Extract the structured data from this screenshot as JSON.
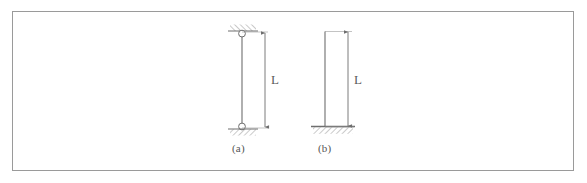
{
  "figure": {
    "caption_a": "(a)",
    "caption_b": "(b)",
    "dimension_label_a": "L",
    "dimension_label_b": "L",
    "border_color": "#9a9a9a",
    "line_color": "#6e6e6e",
    "hatch_color": "#8a8a8a",
    "text_color": "#555555",
    "background_color": "#ffffff"
  },
  "diagram_a": {
    "name": "pinned-pinned column",
    "top_support": "pin",
    "bottom_support": "pin",
    "column_x": 242,
    "column_top_y": 33,
    "column_bottom_y": 127,
    "dimension_x": 265,
    "pin_radius": 3.4
  },
  "diagram_b": {
    "name": "fixed-free cantilever column",
    "top_support": "free",
    "bottom_support": "fixed",
    "column_x": 325,
    "column_top_y": 32,
    "column_bottom_y": 127,
    "dimension_x": 348,
    "base_plate_left": 313,
    "base_plate_right": 354
  }
}
